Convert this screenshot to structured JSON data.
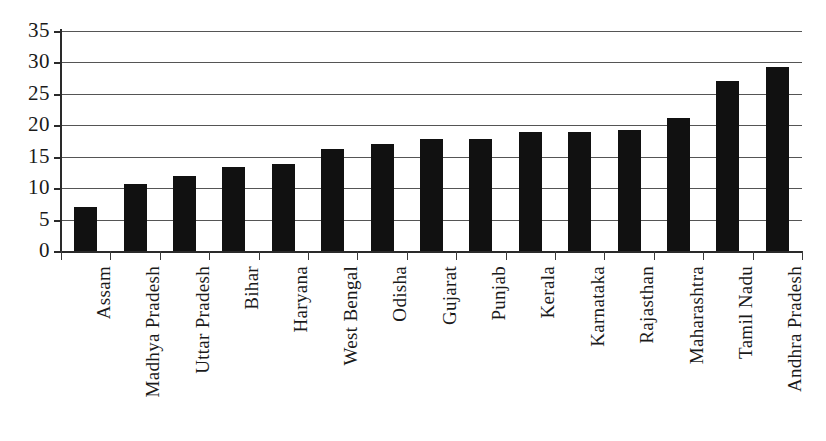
{
  "chart_data": {
    "type": "bar",
    "title": "",
    "subtitle": "",
    "xlabel": "",
    "ylabel": "",
    "ylim": [
      0,
      35
    ],
    "ytick_step": 5,
    "yticks": [
      "0",
      "5",
      "10",
      "15",
      "20",
      "25",
      "30",
      "35"
    ],
    "grid": "horizontal",
    "legend": "none",
    "orientation": "vertical",
    "bar_color": "#111111",
    "gridline_color": "#555555",
    "axis_color": "#2a2a2a",
    "background_color": "#ffffff",
    "categories": [
      "Assam",
      "Madhya Pradesh",
      "Uttar Pradesh",
      "Bihar",
      "Haryana",
      "West Bengal",
      "Odisha",
      "Gujarat",
      "Punjab",
      "Kerala",
      "Karnataka",
      "Rajasthan",
      "Maharashtra",
      "Tamil Nadu",
      "Andhra Pradesh"
    ],
    "values": [
      7.0,
      10.6,
      11.9,
      13.4,
      13.8,
      16.3,
      17.1,
      17.8,
      17.9,
      19.0,
      19.0,
      19.2,
      21.2,
      27.1,
      29.3
    ],
    "xtick_label_rotation": -90
  }
}
